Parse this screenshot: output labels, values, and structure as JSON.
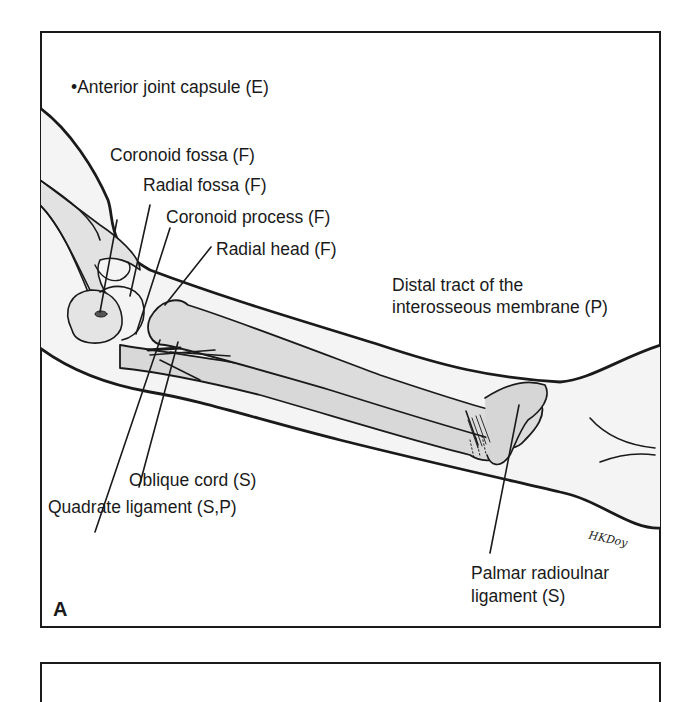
{
  "figure": {
    "panel_letter": "A",
    "signature": "HKDoy",
    "labels": {
      "anterior_joint_capsule": "•Anterior joint capsule (E)",
      "coronoid_fossa": "Coronoid fossa (F)",
      "radial_fossa": "Radial fossa (F)",
      "coronoid_process": "Coronoid process (F)",
      "radial_head": "Radial head (F)",
      "distal_tract_line1": "Distal tract of the",
      "distal_tract_line2": "interosseous membrane (P)",
      "oblique_cord": "Oblique cord (S)",
      "quadrate_ligament": "Quadrate ligament (S,P)",
      "palmar_radioulnar_line1": "Palmar radioulnar",
      "palmar_radioulnar_line2": "ligament (S)"
    },
    "colors": {
      "line": "#1a1a1a",
      "arm_fill": "#f3f3f3",
      "bone_fill": "#d9d9d9",
      "background": "#ffffff"
    }
  }
}
